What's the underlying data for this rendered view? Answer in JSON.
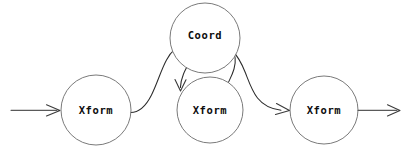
{
  "diagram": {
    "background_color": "#ffffff",
    "node_stroke_color": "#6b6b6b",
    "edge_color": "#2b2b2b",
    "label_color": "#0d0d0d",
    "nodes": [
      {
        "id": "xform-left",
        "label": "Xform",
        "shape": "circle",
        "cx": 96,
        "cy": 110,
        "r": 35
      },
      {
        "id": "coord-top",
        "label": "Coord",
        "shape": "circle",
        "cx": 205,
        "cy": 38,
        "r": 35
      },
      {
        "id": "xform-middle",
        "label": "Xform",
        "shape": "circle",
        "cx": 210,
        "cy": 110,
        "r": 33
      },
      {
        "id": "xform-right",
        "label": "Xform",
        "shape": "circle",
        "cx": 324,
        "cy": 110,
        "r": 34
      }
    ],
    "edges": [
      {
        "id": "input-arrow",
        "kind": "straight",
        "from": "input",
        "to": "xform-left",
        "arrowhead": true
      },
      {
        "id": "left-to-middle-curve",
        "kind": "curved",
        "from": "xform-left",
        "to": "xform-middle",
        "arrowhead": true
      },
      {
        "id": "coord-to-middle-loop",
        "kind": "curved",
        "from": "coord-top",
        "to": "xform-middle",
        "arrowhead": false
      },
      {
        "id": "coord-to-right-curve",
        "kind": "curved",
        "from": "coord-top",
        "to": "xform-right",
        "arrowhead": true
      },
      {
        "id": "output-arrow",
        "kind": "straight",
        "from": "xform-right",
        "to": "output",
        "arrowhead": true
      }
    ]
  }
}
